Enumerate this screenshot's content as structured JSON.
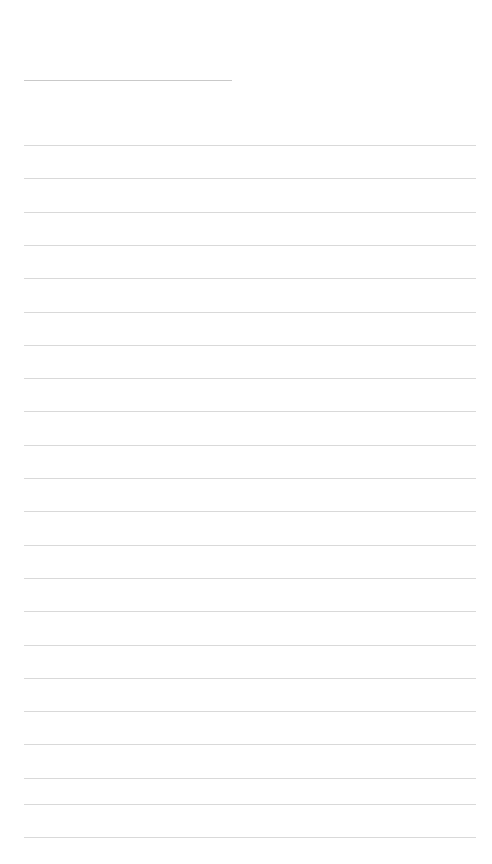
{
  "page": {
    "name": "ruled-paper-page",
    "width_px": 492,
    "height_px": 864,
    "background_color": "#ffffff",
    "title_text": "",
    "body_text": ""
  },
  "colors": {
    "background": "#ffffff",
    "heading_rule": "#c9c9c9",
    "body_rule": "#d9d9d9"
  },
  "heading_rule": {
    "name": "heading-underline",
    "y": 80,
    "x_start": 24,
    "x_end": 232,
    "width": 208,
    "thickness": 1,
    "color": "#c9c9c9"
  },
  "body_rules": {
    "count": 22,
    "x_start": 24,
    "x_end": 476,
    "width": 452,
    "thickness": 1,
    "color": "#d9d9d9",
    "spacing": 33.3,
    "first_y": 145,
    "last_y": 837,
    "y_positions": [
      145,
      178.3,
      211.6,
      244.9,
      278.2,
      311.5,
      344.8,
      378.1,
      411.4,
      444.7,
      478,
      511.3,
      544.6,
      577.9,
      611.2,
      644.5,
      677.8,
      711.1,
      744.4,
      777.7,
      803.5,
      836.8
    ]
  },
  "text_lines": [
    "",
    "",
    "",
    "",
    "",
    "",
    "",
    "",
    "",
    "",
    "",
    "",
    "",
    "",
    "",
    "",
    "",
    "",
    "",
    "",
    "",
    ""
  ]
}
